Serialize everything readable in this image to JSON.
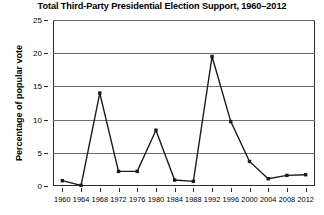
{
  "chart_data": {
    "type": "line",
    "title": "Total Third-Party Presidential Election Support, 1960–2012",
    "xlabel": "",
    "ylabel": "Percentage of popular vote",
    "categories": [
      1960,
      1964,
      1968,
      1972,
      1976,
      1980,
      1984,
      1988,
      1992,
      1996,
      2000,
      2004,
      2008,
      2012
    ],
    "x_tick_labels": [
      "1960",
      "1964",
      "1968",
      "1972",
      "1976",
      "1980",
      "1984",
      "1988",
      "1992",
      "1996",
      "2000",
      "2004",
      "2008",
      "2012"
    ],
    "y_tick_labels": [
      "0",
      "5",
      "10",
      "15",
      "20",
      "25"
    ],
    "y_ticks": [
      0,
      5,
      10,
      15,
      20,
      25
    ],
    "ylim": [
      0,
      25
    ],
    "xlim": [
      1958,
      2014
    ],
    "grid": "horizontal",
    "legend": "none",
    "series": [
      {
        "name": "Third-party share of popular vote",
        "color": "#1a1a1a",
        "marker": "square",
        "values": [
          0.8,
          0.1,
          14.0,
          2.2,
          2.2,
          8.4,
          0.9,
          0.7,
          19.5,
          9.7,
          3.7,
          1.1,
          1.6,
          1.7
        ]
      }
    ]
  }
}
